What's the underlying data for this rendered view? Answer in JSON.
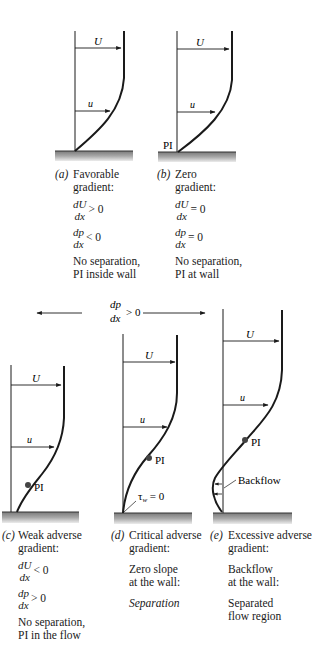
{
  "figure": {
    "symbols": {
      "U": "U",
      "u": "u",
      "PI": "PI",
      "tau_w": "τ",
      "tau_w_sub": "w",
      "tau_w_eq": " = 0",
      "backflow": "Backflow"
    },
    "pressure_arrow": {
      "num": "dp",
      "den": "dx",
      "rel": "> 0"
    },
    "panels": [
      {
        "id": "a",
        "tag": "(a)",
        "title_line1": "Favorable",
        "title_line2": "gradient:",
        "cond1": {
          "num": "dU",
          "den": "dx",
          "rel": "> 0"
        },
        "cond2": {
          "num": "dp",
          "den": "dx",
          "rel": "< 0"
        },
        "note_line1": "No separation,",
        "note_line2": "PI inside wall"
      },
      {
        "id": "b",
        "tag": "(b)",
        "title_line1": "Zero",
        "title_line2": "gradient:",
        "cond1": {
          "num": "dU",
          "den": "dx",
          "rel": "= 0"
        },
        "cond2": {
          "num": "dp",
          "den": "dx",
          "rel": "= 0"
        },
        "note_line1": "No separation,",
        "note_line2": "PI at wall"
      },
      {
        "id": "c",
        "tag": "(c)",
        "title_line1": "Weak adverse",
        "title_line2": "gradient:",
        "cond1": {
          "num": "dU",
          "den": "dx",
          "rel": "< 0"
        },
        "cond2": {
          "num": "dp",
          "den": "dx",
          "rel": "> 0"
        },
        "note_line1": "No separation,",
        "note_line2": "PI in the flow"
      },
      {
        "id": "d",
        "tag": "(d)",
        "title_line1": "Critical adverse",
        "title_line2": "gradient:",
        "desc_line1": "Zero slope",
        "desc_line2": "at the wall:",
        "result": "Separation"
      },
      {
        "id": "e",
        "tag": "(e)",
        "title_line1": "Excessive adverse",
        "title_line2": "gradient:",
        "desc_line1": "Backflow",
        "desc_line2": "at the wall:",
        "result_line1": "Separated",
        "result_line2": "flow region"
      }
    ]
  }
}
